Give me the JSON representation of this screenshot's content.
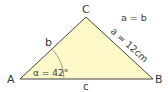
{
  "diagram": {
    "vertices": {
      "A": "A",
      "B": "B",
      "C": "C"
    },
    "sides": {
      "a": "a = 12cm",
      "b": "b",
      "c": "c"
    },
    "angle": "α = 42°",
    "note": "a = b",
    "colors": {
      "fill": "#fdf8c8",
      "stroke": "#444444",
      "arc": "#888888"
    }
  }
}
